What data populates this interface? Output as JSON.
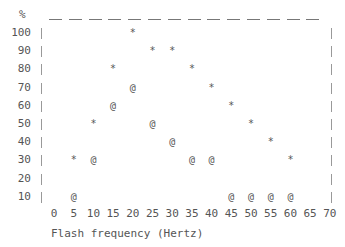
{
  "chart_data": {
    "type": "scatter",
    "title": "",
    "xlabel": "Flash frequency (Hertz)",
    "ylabel": "%",
    "xlim": [
      0,
      70
    ],
    "ylim": [
      10,
      100
    ],
    "x_ticks": [
      "0",
      "5",
      "10",
      "15",
      "20",
      "25",
      "30",
      "35",
      "40",
      "45",
      "50",
      "55",
      "60",
      "65",
      "70"
    ],
    "y_ticks": [
      "100",
      "90",
      "80",
      "70",
      "60",
      "50",
      "40",
      "30",
      "20",
      "10"
    ],
    "grid": false,
    "legend": null,
    "series": [
      {
        "name": "*",
        "marker": "*",
        "x": [
          5,
          10,
          15,
          20,
          25,
          30,
          35,
          40,
          45,
          50,
          55,
          60
        ],
        "values": [
          30,
          50,
          80,
          100,
          90,
          90,
          80,
          70,
          60,
          50,
          40,
          30
        ]
      },
      {
        "name": "@",
        "marker": "@",
        "x": [
          5,
          10,
          15,
          20,
          25,
          30,
          35,
          40,
          45,
          50,
          55,
          60
        ],
        "values": [
          10,
          30,
          60,
          70,
          50,
          40,
          30,
          30,
          10,
          10,
          10,
          10
        ]
      }
    ]
  }
}
